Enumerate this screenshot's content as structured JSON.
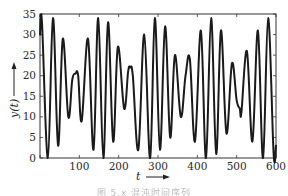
{
  "chart_data": {
    "type": "line",
    "title": "",
    "xlabel": "t",
    "ylabel": "y(t)",
    "xlim": [
      0,
      600
    ],
    "ylim": [
      0,
      35
    ],
    "grid": false,
    "legend": null,
    "x_ticks": [
      0,
      100,
      200,
      300,
      400,
      500,
      600
    ],
    "x_tick_labels": [
      "100",
      "200",
      "300",
      "400",
      "500",
      "600"
    ],
    "y_ticks": [
      0,
      5,
      10,
      15,
      20,
      25,
      30,
      35
    ],
    "y_tick_labels": [
      "0",
      "5",
      "10",
      "15",
      "20",
      "25",
      "30",
      "35"
    ],
    "series": [
      {
        "name": "y(t)",
        "color": "#1a1a1a",
        "x": [
          0,
          5,
          20,
          33,
          46,
          58,
          72,
          82,
          90,
          97,
          106,
          122,
          136,
          148,
          161,
          173,
          186,
          198,
          214,
          224,
          229,
          236,
          250,
          265,
          280,
          292,
          305,
          318,
          331,
          343,
          358,
          370,
          381,
          394,
          409,
          422,
          435,
          448,
          460,
          474,
          488,
          500,
          508,
          512,
          526,
          540,
          554,
          567,
          580,
          594,
          600
        ],
        "y": [
          30,
          33,
          0,
          34,
          3,
          29,
          10,
          19,
          20.5,
          20,
          9,
          29,
          2,
          34,
          0,
          33,
          4,
          27,
          12,
          21,
          22,
          20,
          2,
          30,
          0,
          34,
          2,
          32,
          5,
          25,
          10,
          20,
          24,
          4,
          31,
          0,
          34,
          1,
          31,
          6,
          23,
          14,
          12,
          11,
          26,
          4,
          31,
          0,
          34,
          1,
          3
        ]
      }
    ]
  },
  "caption": {
    "text": "图 5.x 混沌时间序列"
  }
}
